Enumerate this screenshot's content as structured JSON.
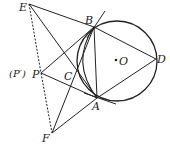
{
  "diagram": {
    "type": "geometry",
    "points": {
      "E": {
        "label": "E",
        "x": 29,
        "y": 4
      },
      "B": {
        "label": "B",
        "x": 94,
        "y": 27
      },
      "D": {
        "label": "D",
        "x": 156,
        "y": 59
      },
      "O": {
        "label": "O",
        "x": 117,
        "y": 61
      },
      "C": {
        "label": "C",
        "x": 77,
        "y": 73
      },
      "P": {
        "label": "P",
        "x": 41,
        "y": 73
      },
      "A": {
        "label": "A",
        "x": 97,
        "y": 98
      },
      "F": {
        "label": "F",
        "x": 52,
        "y": 133
      }
    },
    "p_prime_label": "(P′)",
    "circle": {
      "center": "O",
      "r": 40
    },
    "colors": {
      "stroke": "#222222",
      "background": "#ffffff"
    }
  }
}
